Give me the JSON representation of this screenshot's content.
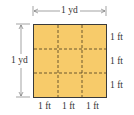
{
  "diagram": {
    "type": "grid-square",
    "rows": 3,
    "cols": 3,
    "fill_color": "#F7CB6A",
    "border_color": "#3A3A3A",
    "dash_color": "#4A3A20",
    "top_dimension": "1 yd",
    "left_dimension": "1 yd",
    "right_labels": [
      "1 ft",
      "1 ft",
      "1 ft"
    ],
    "bottom_labels": [
      "1 ft",
      "1 ft",
      "1 ft"
    ]
  }
}
